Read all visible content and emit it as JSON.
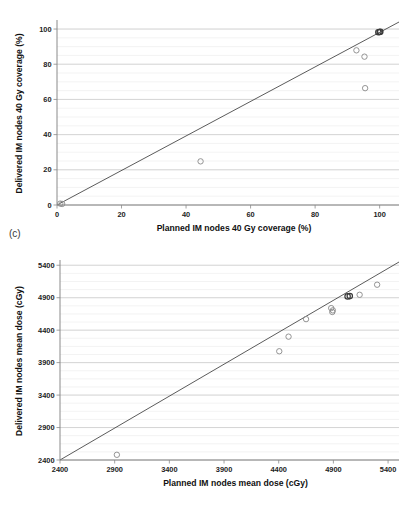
{
  "figure": {
    "background_color": "#ffffff",
    "point_color": "#8e8e8e",
    "line_color": "#3d3d3d",
    "grid_major_color": "#c9c9c9",
    "grid_minor_color": "#e6e6e6"
  },
  "panels": {
    "c": {
      "tag": "(c)"
    },
    "d": {
      "tag": "(d)"
    }
  },
  "chart_data": [
    {
      "id": "panel-c",
      "type": "scatter",
      "title": "",
      "panel_label": "(c)",
      "xlabel": "Planned IM nodes 40 Gy coverage (%)",
      "ylabel": "Delivered IM nodes 40 Gy coverage (%)",
      "xlim": [
        0,
        106
      ],
      "ylim": [
        0,
        104
      ],
      "xticks": [
        0,
        20,
        40,
        60,
        80,
        100
      ],
      "xticklabels": [
        "0",
        "20",
        "40",
        "60",
        "80",
        "100"
      ],
      "yticks": [
        0,
        20,
        40,
        60,
        80,
        100
      ],
      "yticklabels": [
        "0",
        "20",
        "40",
        "60",
        "80",
        "100"
      ],
      "grid": "horizontal-major-and-minor",
      "minor_y_step": 5,
      "legend": "none",
      "reference_line": {
        "type": "identity",
        "label": "y = x",
        "from": [
          0,
          0
        ],
        "to": [
          106,
          104
        ]
      },
      "points": [
        {
          "x": 1.0,
          "y": 0.8
        },
        {
          "x": 1.6,
          "y": 0.6
        },
        {
          "x": 44.5,
          "y": 24.8
        },
        {
          "x": 92.8,
          "y": 87.9
        },
        {
          "x": 95.3,
          "y": 84.3
        },
        {
          "x": 95.5,
          "y": 66.4
        },
        {
          "x": 99.6,
          "y": 98.2
        },
        {
          "x": 100.0,
          "y": 98.3
        },
        {
          "x": 100.2,
          "y": 98.5
        }
      ]
    },
    {
      "id": "panel-d",
      "type": "scatter",
      "title": "",
      "panel_label": "(d)",
      "xlabel": "Planned IM nodes mean dose (cGy)",
      "ylabel": "Delivered IM nodes mean dose (cGy)",
      "xlim": [
        2400,
        5500
      ],
      "ylim": [
        2400,
        5450
      ],
      "xticks": [
        2400,
        2900,
        3400,
        3900,
        4400,
        4900,
        5400
      ],
      "xticklabels": [
        "2400",
        "2900",
        "3400",
        "3900",
        "4400",
        "4900",
        "5400"
      ],
      "yticks": [
        2400,
        2900,
        3400,
        3900,
        4400,
        4900,
        5400
      ],
      "yticklabels": [
        "2400",
        "2900",
        "3400",
        "3900",
        "4400",
        "4900",
        "5400"
      ],
      "grid": "horizontal-major-and-minor",
      "minor_y_step": 125,
      "legend": "none",
      "reference_line": {
        "type": "identity",
        "label": "y = x",
        "from": [
          2400,
          2400
        ],
        "to": [
          5500,
          5450
        ]
      },
      "points": [
        {
          "x": 2920,
          "y": 2480
        },
        {
          "x": 4405,
          "y": 4075
        },
        {
          "x": 4490,
          "y": 4300
        },
        {
          "x": 4650,
          "y": 4570
        },
        {
          "x": 4880,
          "y": 4740
        },
        {
          "x": 4890,
          "y": 4680
        },
        {
          "x": 4895,
          "y": 4705
        },
        {
          "x": 5030,
          "y": 4920
        },
        {
          "x": 5050,
          "y": 4925
        },
        {
          "x": 5140,
          "y": 4945
        },
        {
          "x": 5300,
          "y": 5100
        }
      ]
    }
  ]
}
